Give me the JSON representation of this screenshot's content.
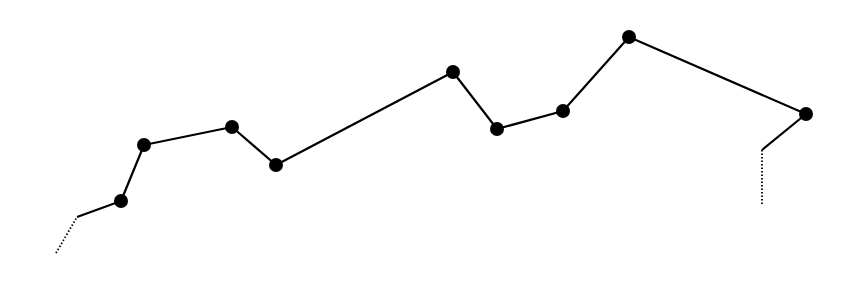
{
  "chart_data": {
    "type": "line",
    "title": "",
    "xlabel": "",
    "ylabel": "",
    "grid": false,
    "legend": null,
    "style": {
      "line_color": "#000000",
      "marker_color": "#000000",
      "line_width": 2.2,
      "marker_radius": 7,
      "background": "#ffffff"
    },
    "points": [
      {
        "x": 121,
        "y": 201
      },
      {
        "x": 144,
        "y": 145
      },
      {
        "x": 232,
        "y": 127
      },
      {
        "x": 276,
        "y": 165
      },
      {
        "x": 453,
        "y": 72
      },
      {
        "x": 497,
        "y": 129
      },
      {
        "x": 563,
        "y": 111
      },
      {
        "x": 629,
        "y": 37
      },
      {
        "x": 806,
        "y": 114
      }
    ],
    "lead_in": {
      "dotted": [
        {
          "x": 56,
          "y": 253
        },
        {
          "x": 77,
          "y": 217
        }
      ],
      "solid": [
        {
          "x": 77,
          "y": 217
        },
        {
          "x": 121,
          "y": 201
        }
      ]
    },
    "lead_out": {
      "solid": [
        {
          "x": 806,
          "y": 114
        },
        {
          "x": 762,
          "y": 150
        }
      ],
      "dotted": [
        {
          "x": 762,
          "y": 150
        },
        {
          "x": 762,
          "y": 205
        }
      ]
    }
  }
}
